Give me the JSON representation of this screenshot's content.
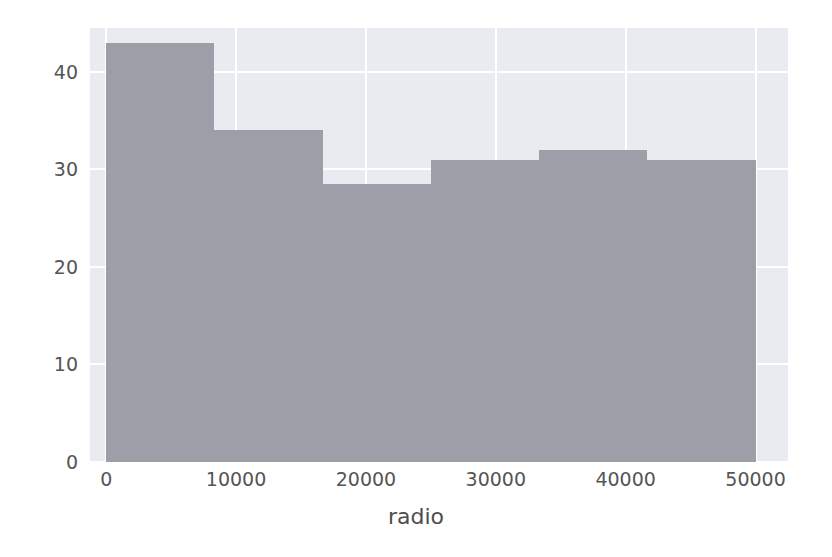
{
  "figure": {
    "width": 832,
    "height": 557,
    "background_color": "#ffffff",
    "plot_background_color": "#eaeaf1",
    "grid_color": "#ffffff",
    "bar_color": "#9e9ea8",
    "tick_label_color": "#555555",
    "axis_label_color": "#4d4d4d"
  },
  "chart_data": {
    "type": "bar",
    "chart_subtype": "histogram",
    "title": "",
    "xlabel": "radio",
    "ylabel": "",
    "xlim": [
      -1250,
      52500
    ],
    "ylim": [
      0,
      44.5
    ],
    "grid": true,
    "legend": null,
    "xticks": [
      0,
      10000,
      20000,
      30000,
      40000,
      50000
    ],
    "xticklabels": [
      "0",
      "10000",
      "20000",
      "30000",
      "40000",
      "50000"
    ],
    "yticks": [
      0,
      10,
      20,
      30,
      40
    ],
    "yticklabels": [
      "0",
      "10",
      "20",
      "30",
      "40"
    ],
    "bin_edges": [
      0,
      8333,
      16667,
      25000,
      33333,
      41667,
      50000
    ],
    "categories": [
      "0-8333",
      "8333-16667",
      "16667-25000",
      "25000-33333",
      "33333-41667",
      "41667-50000"
    ],
    "values": [
      43,
      34,
      28.5,
      31,
      32,
      31
    ]
  }
}
